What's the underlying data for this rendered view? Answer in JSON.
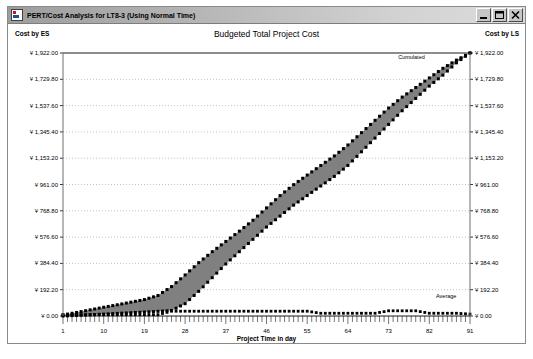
{
  "window": {
    "title": "PERT/Cost Analysis for LT8-3 (Using Normal Time)",
    "icon": "app-chart-icon",
    "buttons": {
      "minimize": "minimize-button",
      "maximize": "maximize-button",
      "close": "close-button"
    }
  },
  "chart": {
    "title": "Budgeted Total Project Cost",
    "left_axis_title": "Cost by ES",
    "right_axis_title": "Cost by LS",
    "xlabel": "Project Time in day",
    "annotations": {
      "cumulated": "Cumulated",
      "average": "Average"
    }
  },
  "chart_data": {
    "type": "area",
    "title": "Budgeted Total Project Cost",
    "xlabel": "Project Time in day",
    "ylabel": "Cost by ES",
    "y2label": "Cost by LS",
    "grid": true,
    "legend_position": "inline-annotation",
    "xlim": [
      1,
      91
    ],
    "ylim": [
      0,
      1922
    ],
    "xticks": [
      1,
      10,
      19,
      28,
      37,
      46,
      55,
      64,
      73,
      82,
      91
    ],
    "xtick_labels": [
      "1",
      "10",
      "19",
      "28",
      "37",
      "46",
      "55",
      "64",
      "73",
      "82",
      "91"
    ],
    "yticks": [
      0,
      192.2,
      384.4,
      576.6,
      768.8,
      961,
      1153.2,
      1345.4,
      1537.6,
      1729.8,
      1922
    ],
    "ytick_labels": [
      "¥ 0.00",
      "¥ 192.20",
      "¥ 384.40",
      "¥ 576.60",
      "¥ 768.80",
      "¥ 961.00",
      "¥ 1,153.20",
      "¥ 1,345.40",
      "¥ 1,537.60",
      "¥ 1,729.80",
      "¥ 1,922.00"
    ],
    "band_fill_color": "#808080",
    "line_color": "#000000",
    "series": [
      {
        "name": "Cumulated cost by ES",
        "marker": "dot",
        "x": [
          1,
          4,
          7,
          10,
          13,
          16,
          19,
          22,
          25,
          28,
          31,
          34,
          37,
          40,
          43,
          46,
          49,
          52,
          55,
          58,
          61,
          64,
          67,
          70,
          73,
          76,
          79,
          82,
          85,
          88,
          91
        ],
        "values": [
          8,
          26,
          45,
          64,
          82,
          101,
          120,
          150,
          215,
          300,
          390,
          470,
          545,
          620,
          700,
          790,
          880,
          960,
          1030,
          1100,
          1170,
          1250,
          1340,
          1430,
          1520,
          1600,
          1670,
          1740,
          1810,
          1870,
          1922
        ]
      },
      {
        "name": "Cumulated cost by LS",
        "marker": "dot",
        "x": [
          1,
          4,
          7,
          10,
          13,
          16,
          19,
          22,
          25,
          28,
          31,
          34,
          37,
          40,
          43,
          46,
          49,
          52,
          55,
          58,
          61,
          64,
          67,
          70,
          73,
          76,
          79,
          82,
          85,
          88,
          91
        ],
        "values": [
          0,
          4,
          9,
          14,
          19,
          24,
          29,
          34,
          40,
          90,
          180,
          280,
          380,
          470,
          560,
          650,
          730,
          810,
          880,
          950,
          1020,
          1100,
          1200,
          1300,
          1400,
          1500,
          1590,
          1680,
          1760,
          1850,
          1922
        ]
      },
      {
        "name": "Average",
        "marker": "dot",
        "x": [
          1,
          4,
          7,
          10,
          13,
          16,
          19,
          22,
          25,
          28,
          31,
          34,
          37,
          40,
          43,
          46,
          49,
          52,
          55,
          58,
          61,
          64,
          67,
          70,
          73,
          76,
          79,
          82,
          85,
          88,
          91
        ],
        "values": [
          10,
          10,
          10,
          10,
          10,
          10,
          10,
          10,
          35,
          35,
          35,
          35,
          35,
          35,
          35,
          35,
          35,
          35,
          35,
          20,
          20,
          20,
          20,
          20,
          38,
          38,
          38,
          20,
          20,
          20,
          14
        ]
      }
    ]
  }
}
